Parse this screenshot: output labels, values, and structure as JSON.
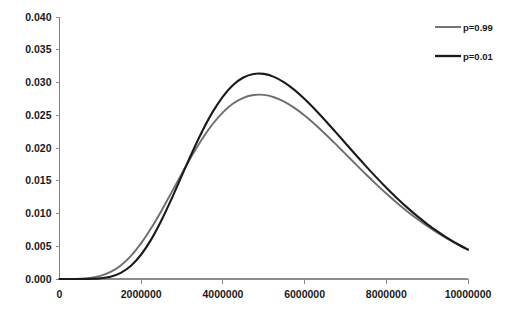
{
  "chart_data": {
    "type": "line",
    "title": "",
    "subtitle": "",
    "xlabel": "",
    "ylabel": "",
    "xlim": [
      0,
      10000000
    ],
    "ylim": [
      0.0,
      0.04
    ],
    "grid": false,
    "legend_position": "top-right",
    "x_ticks": [
      0,
      2000000,
      4000000,
      6000000,
      8000000,
      10000000
    ],
    "x_tick_labels": [
      "0",
      "2000000",
      "4000000",
      "6000000",
      "8000000",
      "10000000"
    ],
    "y_ticks": [
      0.0,
      0.005,
      0.01,
      0.015,
      0.02,
      0.025,
      0.03,
      0.035,
      0.04
    ],
    "y_tick_labels": [
      "0.000",
      "0.005",
      "0.010",
      "0.015",
      "0.020",
      "0.025",
      "0.030",
      "0.035",
      "0.040"
    ],
    "series": [
      {
        "name": "p=0.99",
        "color": "#6e6e6e",
        "width": 1.9,
        "peak_x": 3850000,
        "peak_y": 0.0298,
        "x": [
          0,
          250000,
          500000,
          750000,
          1000000,
          1250000,
          1500000,
          1750000,
          2000000,
          2250000,
          2500000,
          2750000,
          3000000,
          3250000,
          3500000,
          3750000,
          4000000,
          4250000,
          4500000,
          4750000,
          5000000,
          5250000,
          5500000,
          5750000,
          6000000,
          6250000,
          6500000,
          6750000,
          7000000,
          7250000,
          7500000,
          7750000,
          8000000,
          8250000,
          8500000,
          8750000,
          9000000,
          9250000,
          9500000,
          9750000,
          10000000
        ],
        "values": [
          0.0,
          1e-05,
          5e-05,
          0.00018,
          0.00048,
          0.00108,
          0.00208,
          0.00354,
          0.00548,
          0.00782,
          0.01047,
          0.0133,
          0.01616,
          0.01893,
          0.02146,
          0.02366,
          0.02545,
          0.02679,
          0.02767,
          0.0281,
          0.02811,
          0.02775,
          0.02707,
          0.02612,
          0.02496,
          0.02363,
          0.02218,
          0.02066,
          0.0191,
          0.01754,
          0.01599,
          0.01449,
          0.01305,
          0.01168,
          0.01039,
          0.00919,
          0.00808,
          0.00706,
          0.00613,
          0.00529,
          0.00453
        ]
      },
      {
        "name": "p=0.01",
        "color": "#1a1a1a",
        "width": 2.1,
        "peak_x": 4050000,
        "peak_y": 0.0366,
        "x": [
          0,
          250000,
          500000,
          750000,
          1000000,
          1250000,
          1500000,
          1750000,
          2000000,
          2250000,
          2500000,
          2750000,
          3000000,
          3250000,
          3500000,
          3750000,
          4000000,
          4250000,
          4500000,
          4750000,
          5000000,
          5250000,
          5500000,
          5750000,
          6000000,
          6250000,
          6500000,
          6750000,
          7000000,
          7250000,
          7500000,
          7750000,
          8000000,
          8250000,
          8500000,
          8750000,
          9000000,
          9250000,
          9500000,
          9750000,
          10000000
        ],
        "values": [
          0.0,
          0.0,
          0.0,
          2e-05,
          0.0001,
          0.00035,
          0.00094,
          0.00203,
          0.00374,
          0.00609,
          0.00901,
          0.01233,
          0.01585,
          0.01936,
          0.02263,
          0.02551,
          0.02786,
          0.02962,
          0.03076,
          0.03131,
          0.03132,
          0.03086,
          0.03002,
          0.02887,
          0.02748,
          0.02592,
          0.02424,
          0.0225,
          0.02073,
          0.01896,
          0.01723,
          0.01555,
          0.01394,
          0.01241,
          0.01097,
          0.00963,
          0.00839,
          0.00726,
          0.00623,
          0.0053,
          0.00447
        ]
      }
    ],
    "legend": [
      {
        "label": "p=0.99",
        "color": "#6e6e6e"
      },
      {
        "label": "p=0.01",
        "color": "#1a1a1a"
      }
    ]
  },
  "plot_geometry": {
    "left": 59.5,
    "right": 468,
    "top": 17,
    "bottom": 279
  },
  "legend_geometry": {
    "line_x1": 435,
    "line_x2": 461,
    "label_x": 463,
    "row1_y": 27,
    "row2_y": 56
  }
}
